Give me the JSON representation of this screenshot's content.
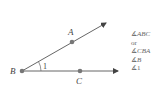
{
  "diagram": {
    "points": {
      "A": {
        "label": "A",
        "x": 72,
        "y": 42
      },
      "B": {
        "label": "B",
        "x": 22,
        "y": 71
      },
      "C": {
        "label": "C",
        "x": 80,
        "y": 71
      }
    },
    "angle_label": "1",
    "colors": {
      "line": "#555555",
      "point": "#777777",
      "text": "#444444"
    }
  },
  "names": {
    "items": [
      {
        "sym": "∡",
        "text": "ABC",
        "italic": true
      },
      {
        "sym": "",
        "text": "or",
        "italic": false
      },
      {
        "sym": "∡",
        "text": "CBA",
        "italic": true
      },
      {
        "sym": "∡",
        "text": "B",
        "italic": true
      },
      {
        "sym": "∡",
        "text": "1",
        "italic": false
      }
    ]
  }
}
